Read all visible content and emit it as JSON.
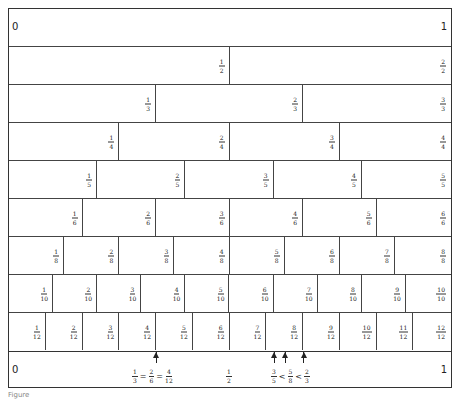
{
  "diagram": {
    "type": "fraction-wall",
    "top_band": {
      "left_label": "0",
      "right_label": "1"
    },
    "rows": [
      {
        "denominator": 2,
        "cells": [
          [
            "1",
            "2"
          ],
          [
            "2",
            "2"
          ]
        ]
      },
      {
        "denominator": 3,
        "cells": [
          [
            "1",
            "3"
          ],
          [
            "2",
            "3"
          ],
          [
            "3",
            "3"
          ]
        ]
      },
      {
        "denominator": 4,
        "cells": [
          [
            "1",
            "4"
          ],
          [
            "2",
            "4"
          ],
          [
            "3",
            "4"
          ],
          [
            "4",
            "4"
          ]
        ]
      },
      {
        "denominator": 5,
        "cells": [
          [
            "1",
            "5"
          ],
          [
            "2",
            "5"
          ],
          [
            "3",
            "5"
          ],
          [
            "4",
            "5"
          ],
          [
            "5",
            "5"
          ]
        ]
      },
      {
        "denominator": 6,
        "cells": [
          [
            "1",
            "6"
          ],
          [
            "2",
            "6"
          ],
          [
            "3",
            "6"
          ],
          [
            "4",
            "6"
          ],
          [
            "5",
            "6"
          ],
          [
            "6",
            "6"
          ]
        ]
      },
      {
        "denominator": 8,
        "cells": [
          [
            "1",
            "8"
          ],
          [
            "2",
            "8"
          ],
          [
            "3",
            "8"
          ],
          [
            "4",
            "8"
          ],
          [
            "5",
            "8"
          ],
          [
            "6",
            "8"
          ],
          [
            "7",
            "8"
          ],
          [
            "8",
            "8"
          ]
        ]
      },
      {
        "denominator": 10,
        "cells": [
          [
            "1",
            "10"
          ],
          [
            "2",
            "10"
          ],
          [
            "3",
            "10"
          ],
          [
            "4",
            "10"
          ],
          [
            "5",
            "10"
          ],
          [
            "6",
            "10"
          ],
          [
            "7",
            "10"
          ],
          [
            "8",
            "10"
          ],
          [
            "9",
            "10"
          ],
          [
            "10",
            "10"
          ]
        ]
      },
      {
        "denominator": 12,
        "cells": [
          [
            "1",
            "12"
          ],
          [
            "2",
            "12"
          ],
          [
            "3",
            "12"
          ],
          [
            "4",
            "12"
          ],
          [
            "5",
            "12"
          ],
          [
            "6",
            "12"
          ],
          [
            "7",
            "12"
          ],
          [
            "8",
            "12"
          ],
          [
            "9",
            "12"
          ],
          [
            "10",
            "12"
          ],
          [
            "11",
            "12"
          ],
          [
            "12",
            "12"
          ]
        ]
      }
    ],
    "bottom_band": {
      "left_label": "0",
      "right_label": "1",
      "equivalence": {
        "fractions": [
          [
            "1",
            "3"
          ],
          [
            "2",
            "6"
          ],
          [
            "4",
            "12"
          ]
        ],
        "operator": "=",
        "position": 0.3333
      },
      "half": {
        "fraction": [
          "1",
          "2"
        ],
        "position": 0.5
      },
      "comparison": {
        "fractions": [
          [
            "3",
            "5"
          ],
          [
            "5",
            "8"
          ],
          [
            "2",
            "3"
          ]
        ],
        "operator": "<",
        "positions": [
          0.6,
          0.625,
          0.6667
        ]
      }
    },
    "caption": "Figure"
  }
}
